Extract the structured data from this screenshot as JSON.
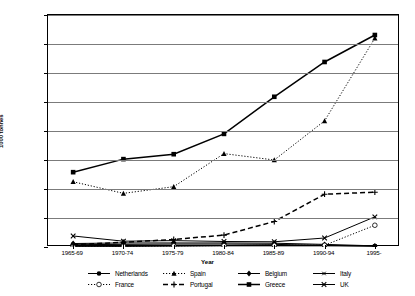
{
  "chart_data": {
    "type": "line",
    "title": "",
    "xlabel": "Year",
    "ylabel": "1000 tonnes",
    "ylim": [
      0,
      800
    ],
    "ytick_step": 100,
    "yticks": [
      "0",
      "100",
      "200",
      "300",
      "400",
      "500",
      "600",
      "700",
      "800"
    ],
    "grid": true,
    "legend_position": "bottom",
    "categories": [
      "1965-69",
      "1970-74",
      "1975-79",
      "1980-84",
      "1985-89",
      "1990-94",
      "1995-"
    ],
    "series": [
      {
        "name": "Netherlands",
        "marker": "filled-circle",
        "line": "solid",
        "values": [
          2,
          2,
          3,
          4,
          4,
          4,
          3
        ]
      },
      {
        "name": "Spain",
        "marker": "filled-triangle",
        "line": "dotted",
        "values": [
          225,
          185,
          208,
          322,
          300,
          435,
          720
        ]
      },
      {
        "name": "Belgium",
        "marker": "filled-diamond",
        "line": "solid",
        "values": [
          12,
          14,
          14,
          14,
          13,
          9,
          4
        ]
      },
      {
        "name": "Italy",
        "marker": "asterisk",
        "line": "solid",
        "values": [
          8,
          9,
          10,
          10,
          9,
          6,
          3
        ]
      },
      {
        "name": "France",
        "marker": "open-circle",
        "line": "dotted",
        "values": [
          3,
          3,
          4,
          5,
          6,
          6,
          75
        ]
      },
      {
        "name": "Portugal",
        "marker": "plus",
        "line": "dashed",
        "values": [
          8,
          16,
          26,
          41,
          88,
          182,
          189
        ]
      },
      {
        "name": "Greece",
        "marker": "filled-square",
        "line": "solid",
        "values": [
          258,
          303,
          320,
          390,
          518,
          638,
          731
        ]
      },
      {
        "name": "UK",
        "marker": "cross",
        "line": "solid",
        "values": [
          38,
          20,
          22,
          19,
          18,
          31,
          104
        ]
      }
    ]
  }
}
